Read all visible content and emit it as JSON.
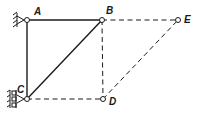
{
  "diagram": {
    "type": "truss-virtual-displacement",
    "nodes": [
      {
        "id": "A",
        "label": "A",
        "x": 27,
        "y": 20,
        "lx": 34,
        "ly": 15
      },
      {
        "id": "B",
        "label": "B",
        "x": 102,
        "y": 20,
        "lx": 106,
        "ly": 14
      },
      {
        "id": "E",
        "label": "E",
        "x": 178,
        "y": 20,
        "lx": 184,
        "ly": 23
      },
      {
        "id": "C",
        "label": "C",
        "x": 27,
        "y": 99,
        "lx": 17,
        "ly": 93
      },
      {
        "id": "D",
        "label": "D",
        "x": 103,
        "y": 99,
        "lx": 109,
        "ly": 105
      }
    ],
    "members_solid": [
      [
        "A",
        "B"
      ],
      [
        "A",
        "C"
      ],
      [
        "C",
        "B"
      ]
    ],
    "members_dashed": [
      [
        "B",
        "E"
      ],
      [
        "B",
        "D"
      ],
      [
        "C",
        "D"
      ],
      [
        "D",
        "E"
      ]
    ],
    "supports": [
      {
        "node": "A",
        "type": "pin-wall-left"
      },
      {
        "node": "C",
        "type": "roller-wall-left"
      }
    ],
    "colors": {
      "line": "#1a1a1a",
      "background": "#ffffff"
    }
  }
}
